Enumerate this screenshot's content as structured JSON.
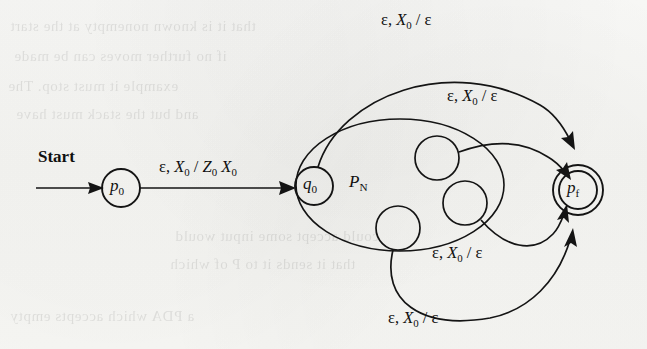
{
  "figure": {
    "kind": "pda-state-diagram",
    "ink_color": "#141414",
    "paper_color": "#f7f7f5"
  },
  "start": {
    "label": "Start"
  },
  "states": {
    "p0": {
      "name": "p",
      "sub": "0",
      "accepting": false
    },
    "q0": {
      "name": "q",
      "sub": "0",
      "accepting": false
    },
    "pf": {
      "name": "p",
      "sub": "f",
      "accepting": true
    },
    "inner1": {
      "name": "",
      "sub": ""
    },
    "inner2": {
      "name": "",
      "sub": ""
    },
    "inner3": {
      "name": "",
      "sub": ""
    }
  },
  "region": {
    "name": "P",
    "sub": "N"
  },
  "transitions": {
    "init": {
      "from": "p0",
      "to": "q0",
      "input": "ε",
      "pop": "X",
      "pop_sub": "0",
      "push": "Z",
      "push_sub": "0",
      "push2": "X",
      "push2_sub": "0",
      "sep": ","
    },
    "accept_input": "ε",
    "accept_pop": "X",
    "accept_pop_sub": "0",
    "accept_push": "ε",
    "accept_count": 4
  },
  "ghost_text": {
    "lines": [
      "that it is known nonempty at the start",
      "if no further moves can be made",
      "example it must stop. The",
      "and but the stack must have",
      "could accept some input would",
      "that it sends it to P of which",
      "a PDA which accepts empty"
    ]
  }
}
